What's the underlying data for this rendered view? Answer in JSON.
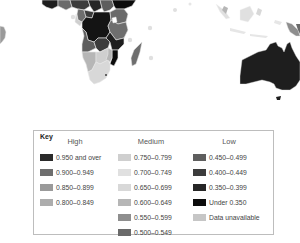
{
  "map": {
    "regions_visible": [
      "South America (edge)",
      "Africa",
      "Madagascar",
      "Indian Ocean islands",
      "Southeast Asia / Indonesia",
      "New Guinea",
      "Australia",
      "Tasmania"
    ],
    "colors": {
      "ocean": "#ffffff",
      "border": "#e6e6e6"
    }
  },
  "key": {
    "title": "Key",
    "groups": [
      {
        "name": "High",
        "items": [
          {
            "label": "0.950 and over",
            "color": "#2a2a2a"
          },
          {
            "label": "0.900–0.949",
            "color": "#6e6e6e"
          },
          {
            "label": "0.850–0.899",
            "color": "#9a9a9a"
          },
          {
            "label": "0.800–0.849",
            "color": "#adadad"
          }
        ]
      },
      {
        "name": "Medium",
        "items": [
          {
            "label": "0.750–0.799",
            "color": "#cfcfcf"
          },
          {
            "label": "0.700–0.749",
            "color": "#e0e0e0"
          },
          {
            "label": "0.650–0.699",
            "color": "#d8d8d8"
          },
          {
            "label": "0.600–0.649",
            "color": "#b6b6b6"
          },
          {
            "label": "0.550–0.599",
            "color": "#8e8e8e"
          },
          {
            "label": "0.500–0.549",
            "color": "#6a6a6a"
          }
        ]
      },
      {
        "name": "Low",
        "items": [
          {
            "label": "0.450–0.499",
            "color": "#5e5e5e"
          },
          {
            "label": "0.400–0.449",
            "color": "#3c3c3c"
          },
          {
            "label": "0.350–0.399",
            "color": "#262626"
          },
          {
            "label": "Under 0.350",
            "color": "#0c0c0c"
          },
          {
            "label": "Data unavailable",
            "color": "#c6c6c6"
          }
        ]
      }
    ]
  }
}
